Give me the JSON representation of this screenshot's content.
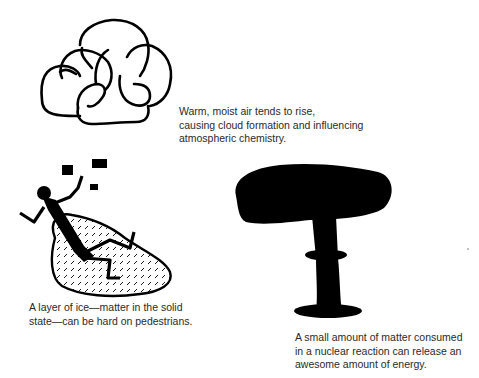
{
  "figure": {
    "panels": [
      {
        "id": "gas",
        "illustration": "cloud-icon",
        "caption_lines": [
          "Warm, moist air tends to rise,",
          "causing cloud formation and influencing",
          "atmospheric chemistry."
        ]
      },
      {
        "id": "solid",
        "illustration": "person-slipping-on-ice-icon",
        "caption_lines": [
          "A layer of ice—matter in the solid",
          "state—can be hard on pedestrians."
        ]
      },
      {
        "id": "nuclear",
        "illustration": "mushroom-cloud-icon",
        "caption_lines": [
          "A small amount of matter consumed",
          "in a nuclear reaction can release an",
          "awesome amount of energy."
        ]
      }
    ],
    "colors": {
      "ink": "#000000",
      "text": "#2a2a2a",
      "background": "#ffffff"
    }
  }
}
